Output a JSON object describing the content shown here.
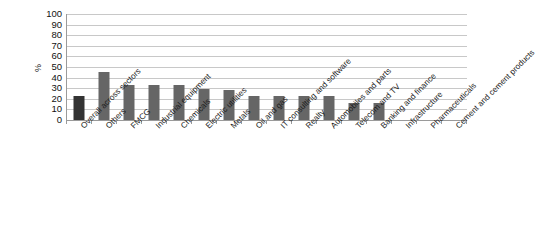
{
  "chart_data": {
    "type": "bar",
    "title": "",
    "xlabel": "",
    "ylabel": "%",
    "ylim": [
      0,
      100
    ],
    "ytick_step": 10,
    "yticks": [
      "100",
      "90",
      "80",
      "70",
      "60",
      "50",
      "40",
      "30",
      "20",
      "10",
      "0"
    ],
    "grid": true,
    "legend": "none",
    "bar_color": "#666666",
    "highlight_color": "#333333",
    "highlight_index": 0,
    "categories": [
      "Overall across sectors",
      "Others",
      "FMCG",
      "Industrial equipment",
      "Chemicals",
      "Electric utilities",
      "Metals",
      "Oil and gas",
      "IT consulting and software",
      "Realty",
      "Automobiles and parts",
      "Telecom and TV",
      "Banking and finance",
      "Infrastructure",
      "Pharmaceuticals",
      "Cement and cement products"
    ],
    "values": [
      23,
      45,
      33,
      33,
      33,
      29,
      28,
      23,
      23,
      23,
      23,
      16,
      16,
      null,
      null,
      null
    ]
  }
}
